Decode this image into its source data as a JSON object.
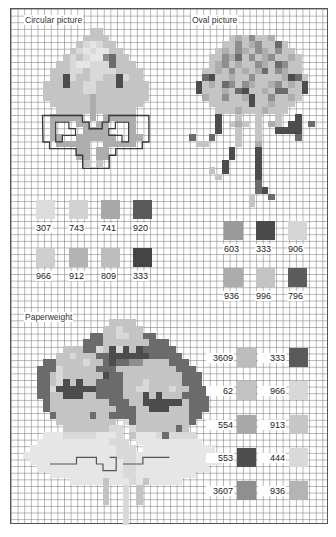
{
  "grid": {
    "left": 10,
    "top": 8,
    "cell": 6.625,
    "cols": 48,
    "rows": 78
  },
  "palette": {
    "a": "#d9d9d9",
    "b": "#c4c4c4",
    "c": "#adadad",
    "d": "#8e8e8e",
    "e": "#6b6b6b",
    "f": "#4c4c4c",
    "g": "#e6e6e6"
  },
  "sections": {
    "circular": {
      "title": "Circular picture",
      "title_x": 24,
      "title_y": 15,
      "origin_col": 2,
      "origin_row": 3,
      "rows": [
        "..........bb..........",
        ".........bbbb.........",
        "........bagabb........",
        ".......bagaggbb.......",
        "......babaggdebb......",
        ".....bbaggaaaebbb.....",
        "....bbbaabaaaabbbb....",
        "....bbfabbaabbfabb....",
        "...bbbfbbaabbbfbbbb...",
        "...bbbbbbaabbbbbbbb...",
        "...bbbbbbbcbbbbbbbb...",
        "....bbbbbbcbbbbbbb....",
        ".....bbbbbcbbbbbb.....",
        "....ccccc.c.ccccc.....",
        "....c...cc.cc...c.....",
        "....c....cccc...c.....",
        "....cc..cccccc..cc....",
        ".....ccccc..ccccc.....",
        "........cc.cc.........",
        "........cc.cc.........",
        ".........b.b.........."
      ],
      "legend": {
        "row1": [
          {
            "code": "307",
            "color": "#dcdcdc",
            "x": 36,
            "y": 200
          },
          {
            "code": "743",
            "color": "#d2d2d2",
            "x": 69,
            "y": 200
          },
          {
            "code": "741",
            "color": "#a9a9a9",
            "x": 101,
            "y": 200
          },
          {
            "code": "920",
            "color": "#5a5a5a",
            "x": 133,
            "y": 200
          }
        ],
        "row2": [
          {
            "code": "966",
            "color": "#cfcfcf",
            "x": 36,
            "y": 248
          },
          {
            "code": "912",
            "color": "#b3b3b3",
            "x": 69,
            "y": 248
          },
          {
            "code": "809",
            "color": "#bdbdbd",
            "x": 101,
            "y": 248
          },
          {
            "code": "333",
            "color": "#444444",
            "x": 133,
            "y": 248
          }
        ]
      }
    },
    "oval": {
      "title": "Oval picture",
      "title_x": 191,
      "title_y": 15,
      "origin_col": 27,
      "origin_row": 4,
      "rows": [
        "......bcbdbbc......",
        ".....bbdbcdbbeb....",
        "....bcbdcbdcbdbb...",
        "...bbdcebdbcdbbcb..",
        "...bcdbcbbdcbedbb..",
        "..bbcbdbcbcebdcbb..",
        "..efbbcbbdbbbbcfeb.",
        ".fbcbedbdcbbcdbcbf.",
        ".fbbbcbefbbcbeebbf.",
        "..cbbdbbcfbbdbbcb..",
        "...bbbbbbfbbcbbb...",
        "....bbbcbbbcbbb....",
        "....f..b..b..b..f..",
        "....f.bcb.b.cb.ff.e",
        "....f..b..b..ffff..",
        "e..e...b..b.....e..",
        ".bb....b..c........",
        "......f...f........",
        "......f...f........",
        ".....f....f........",
        "...b.f....f........",
        "....b.....f........",
        "..........e........",
        "..........ef.......",
        ".........b..e......",
        ".........b........."
      ],
      "legend": {
        "row1": [
          {
            "code": "603",
            "color": "#9a9a9a",
            "x": 224,
            "y": 221
          },
          {
            "code": "333",
            "color": "#4a4a4a",
            "x": 256,
            "y": 221
          },
          {
            "code": "906",
            "color": "#d6d6d6",
            "x": 288,
            "y": 221
          }
        ],
        "row2": [
          {
            "code": "936",
            "color": "#acacac",
            "x": 224,
            "y": 268
          },
          {
            "code": "996",
            "color": "#c4c4c4",
            "x": 256,
            "y": 268
          },
          {
            "code": "796",
            "color": "#5c5c5c",
            "x": 288,
            "y": 268
          }
        ]
      }
    },
    "paperweight": {
      "title": "Paperweight",
      "title_x": 24,
      "title_y": 312,
      "origin_col": 2,
      "origin_row": 47,
      "rows": [
        ".............bbbb.............",
        "............bbabbb............",
        "..........eebbaabbee..........",
        ".........eeebbbbbbbeee........",
        "......bbbeeabfafbfeeeee.......",
        ".....bbabbbeeffffffeeeee......",
        "...eebbbbabbefeeddbbbbeee.....",
        "..eeeabbbbbeeebbbbbbbbbeee....",
        "..eebabbbbbbfeebbbbbbbbbeee...",
        "..eebafbfbbeeeebbbabbbbbeee...",
        "..eeaffffffeeeebbaabbbabbeee..",
        "..eebbfffbbeeeebbbfbfbbbeeee..",
        "...ebbbbbbbbbeeebbffffffbeee..",
        "...ebbbbbbbbbbeeebbfffbbbeee..",
        "....ebbbbbebbeeeebbbbbbbbee...",
        ".....bbbbbbbbb.aebbbbbbbbe....",
        "......bbbbbbbaa.abbbbbbeb.....",
        "...gggaaaaaggga.bgggaeaaaa....",
        "..gggggggggggaaa.gggggggggg...",
        ".gggggggggggggaaa.ggggggggggg.",
        "ggggggggggggggaaaggggggggggggg",
        ".ggggggggggggggaaggggggggggggg",
        "..gggggggggggggaaggggggggggg..",
        "....gggggggggggaaggggggggg....",
        ".......gggggbgggagbggggg......",
        "............b..a.b............",
        "............b..a.b............",
        "............b..a.b............",
        "...............a..............",
        "...............a..............",
        "...............a.............."
      ],
      "legend": [
        {
          "left_code": "3609",
          "left_color": "#bdbdbd",
          "right_code": "333",
          "right_color": "#5a5a5a",
          "y": 348
        },
        {
          "left_code": "62",
          "left_color": "#c2c2c2",
          "right_code": "966",
          "right_color": "#d8d8d8",
          "y": 381
        },
        {
          "left_code": "554",
          "left_color": "#a9a9a9",
          "right_code": "913",
          "right_color": "#c6c6c6",
          "y": 415
        },
        {
          "left_code": "553",
          "left_color": "#4e4e4e",
          "right_code": "444",
          "right_color": "#d9d9d9",
          "y": 448
        },
        {
          "left_code": "3607",
          "left_color": "#8f8f8f",
          "right_code": "936",
          "right_color": "#b4b4b4",
          "y": 481
        }
      ]
    }
  }
}
